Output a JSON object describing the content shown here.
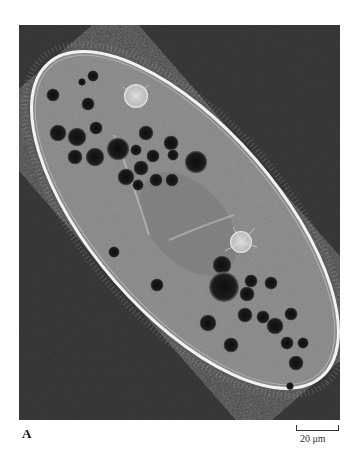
{
  "figure": {
    "panel_label": "A",
    "scale_bar": {
      "label": "20 μm",
      "length_px": 43
    },
    "colors": {
      "background": "#3a3a3a",
      "cytoplasm": "#9a9a9a",
      "pellicle": "#eeeeee",
      "vacuole": "#151515"
    }
  }
}
